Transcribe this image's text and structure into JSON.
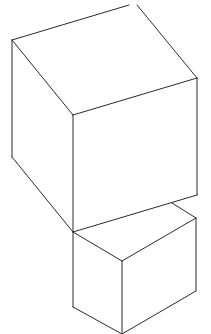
{
  "diagram": {
    "title": "",
    "stroke_color": "#2a2a2a",
    "background": "#ffffff",
    "shapes": [
      {
        "name": "top-cube",
        "edges": [
          [
            12,
            40,
            129,
            5
          ],
          [
            137,
            5,
            197,
            78
          ],
          [
            12,
            40,
            73,
            115
          ],
          [
            73,
            115,
            197,
            78
          ],
          [
            12,
            40,
            12,
            157
          ],
          [
            73,
            115,
            73,
            232
          ],
          [
            197,
            78,
            197,
            195
          ],
          [
            12,
            157,
            73,
            232
          ],
          [
            73,
            232,
            197,
            195
          ]
        ]
      },
      {
        "name": "bottom-cube",
        "edges": [
          [
            172,
            203,
            196,
            218
          ],
          [
            73,
            232,
            122,
            261
          ],
          [
            122,
            261,
            196,
            218
          ],
          [
            73,
            232,
            73,
            307
          ],
          [
            122,
            261,
            122,
            334
          ],
          [
            196,
            218,
            196,
            291
          ],
          [
            73,
            307,
            122,
            334
          ],
          [
            122,
            334,
            196,
            291
          ]
        ]
      }
    ]
  }
}
